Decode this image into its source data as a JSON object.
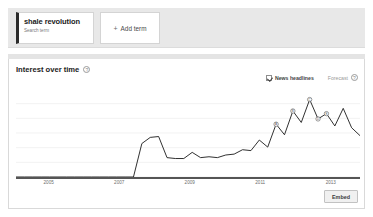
{
  "terms": {
    "cards": [
      {
        "title": "shale revolution",
        "subtitle": "Search term"
      }
    ],
    "add_term": {
      "label": "Add term",
      "plus": "+"
    }
  },
  "panel": {
    "section_title": "Interest over time",
    "title_help_glyph": "?",
    "news_headlines_label": "News headlines",
    "forecast_label": "Forecast",
    "forecast_help_glyph": "?",
    "embed_label": "Embed"
  },
  "chart_data": {
    "type": "line",
    "title": "Interest over time",
    "xlabel": "",
    "ylabel": "",
    "ylim": [
      0,
      100
    ],
    "grid": true,
    "legend": "none",
    "x_tick_labels": [
      "2005",
      "2007",
      "2009",
      "2011",
      "2013"
    ],
    "x_tick_positions_pct": [
      9.5,
      30.0,
      50.5,
      71.0,
      91.5
    ],
    "series": [
      {
        "name": "shale revolution",
        "color": "#1a1a1a",
        "x": [
          "2004-01",
          "2004-07",
          "2005-01",
          "2005-07",
          "2006-01",
          "2006-07",
          "2007-01",
          "2007-07",
          "2008-01",
          "2008-07",
          "2009-01",
          "2009-07",
          "2010-01",
          "2010-07",
          "2010-11",
          "2011-01",
          "2011-03",
          "2011-05",
          "2011-07",
          "2011-09",
          "2011-11",
          "2012-01",
          "2012-03",
          "2012-05",
          "2012-07",
          "2012-09",
          "2012-11",
          "2013-01",
          "2013-02",
          "2013-03",
          "2013-04",
          "2013-05",
          "2013-06",
          "2013-07",
          "2013-08",
          "2013-09",
          "2013-10",
          "2013-11",
          "2013-12",
          "2014-01",
          "2014-02",
          "2014-03"
        ],
        "values": [
          0,
          0,
          0,
          0,
          0,
          0,
          0,
          0,
          0,
          0,
          0,
          0,
          0,
          0,
          0,
          38,
          45,
          46,
          22,
          21,
          21,
          28,
          22,
          23,
          22,
          25,
          26,
          31,
          30,
          42,
          34,
          60,
          48,
          75,
          62,
          88,
          66,
          72,
          58,
          78,
          56,
          47
        ]
      }
    ],
    "news_markers": [
      {
        "x": "2013-05",
        "y": 60,
        "glyph": "A"
      },
      {
        "x": "2013-07",
        "y": 75,
        "glyph": "B"
      },
      {
        "x": "2013-09",
        "y": 88,
        "glyph": "C"
      },
      {
        "x": "2013-10",
        "y": 66,
        "glyph": "D"
      },
      {
        "x": "2013-11",
        "y": 72,
        "glyph": "E"
      }
    ]
  }
}
